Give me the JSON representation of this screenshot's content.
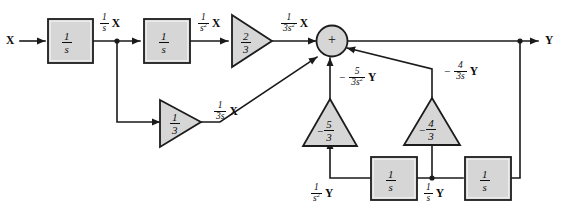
{
  "diagram": {
    "type": "signal-flow block diagram",
    "input_label": "X",
    "output_label": "Y",
    "summing_junction": {
      "sign": "+",
      "name": "summing-junction"
    },
    "blocks": [
      {
        "id": "integrator-1",
        "numerator": "1",
        "denominator": "s",
        "shape": "rect"
      },
      {
        "id": "integrator-2",
        "numerator": "1",
        "denominator": "s",
        "shape": "rect"
      },
      {
        "id": "integrator-fb-1",
        "numerator": "1",
        "denominator": "s",
        "shape": "rect"
      },
      {
        "id": "integrator-fb-2",
        "numerator": "1",
        "denominator": "s",
        "shape": "rect"
      }
    ],
    "gains": [
      {
        "id": "gain-two-thirds",
        "sign": "",
        "numerator": "2",
        "denominator": "3",
        "direction": "right"
      },
      {
        "id": "gain-one-third",
        "sign": "",
        "numerator": "1",
        "denominator": "3",
        "direction": "right"
      },
      {
        "id": "gain-neg-five-thirds",
        "sign": "−",
        "numerator": "5",
        "denominator": "3",
        "direction": "up"
      },
      {
        "id": "gain-neg-four-thirds",
        "sign": "−",
        "numerator": "4",
        "denominator": "3",
        "direction": "up"
      }
    ],
    "signal_labels": [
      {
        "id": "sig-1s-x",
        "sign": "",
        "numerator": "1",
        "denominator": "s",
        "den_exp": "",
        "variable": "X"
      },
      {
        "id": "sig-1s2-x",
        "sign": "",
        "numerator": "1",
        "denominator": "s",
        "den_exp": "2",
        "variable": "X"
      },
      {
        "id": "sig-1over3s2-x",
        "sign": "",
        "numerator": "1",
        "denominator": "3s",
        "den_exp": "2",
        "variable": "X"
      },
      {
        "id": "sig-1over3s-x",
        "sign": "",
        "numerator": "1",
        "denominator": "3s",
        "den_exp": "",
        "variable": "X"
      },
      {
        "id": "sig-neg5over3s2-y",
        "sign": "−",
        "numerator": "5",
        "denominator": "3s",
        "den_exp": "2",
        "variable": "Y"
      },
      {
        "id": "sig-neg4over3s-y",
        "sign": "−",
        "numerator": "4",
        "denominator": "3s",
        "den_exp": "",
        "variable": "Y"
      },
      {
        "id": "sig-1s2-y",
        "sign": "",
        "numerator": "1",
        "denominator": "s",
        "den_exp": "2",
        "variable": "Y"
      },
      {
        "id": "sig-1s-y",
        "sign": "",
        "numerator": "1",
        "denominator": "s",
        "den_exp": "",
        "variable": "Y"
      }
    ],
    "colors": {
      "line": "#1a1a1a",
      "block_fill": "#d6d6d6",
      "block_stroke": "#1c1c1c",
      "background": "#ffffff",
      "text": "#0d0d0d"
    }
  }
}
